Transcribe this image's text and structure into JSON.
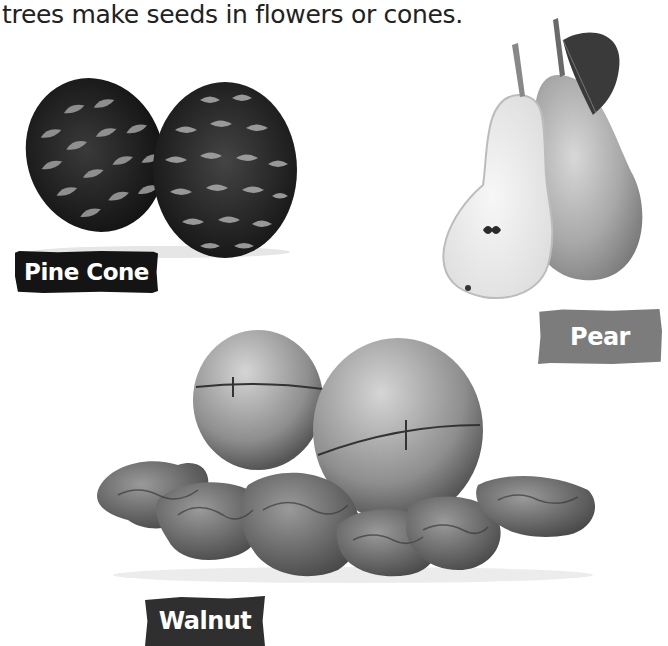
{
  "intro_text": "trees make seeds in flowers or cones.",
  "items": [
    {
      "label": "Pine Cone",
      "image": "pine-cones-photo",
      "label_color": "#141414"
    },
    {
      "label": "Pear",
      "image": "pears-photo",
      "label_color": "#7c7c7c"
    },
    {
      "label": "Walnut",
      "image": "walnuts-photo",
      "label_color": "#2f2f2f"
    }
  ]
}
